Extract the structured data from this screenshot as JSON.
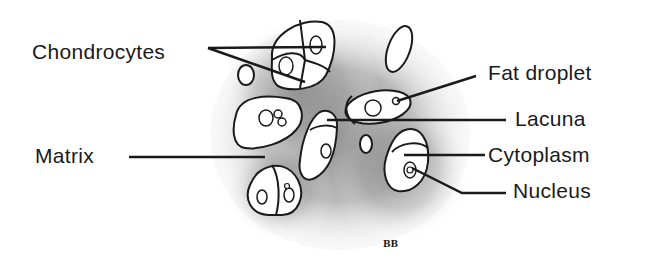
{
  "diagram": {
    "labels": {
      "chondrocytes": "Chondrocytes",
      "fat_droplet": "Fat droplet",
      "lacuna": "Lacuna",
      "matrix": "Matrix",
      "cytoplasm": "Cytoplasm",
      "nucleus": "Nucleus"
    },
    "signature": "BB",
    "colors": {
      "ink": "#1a1a1a",
      "matrix_shade": "#8a8a8a",
      "cell_fill": "#ffffff",
      "background": "#ffffff"
    }
  }
}
